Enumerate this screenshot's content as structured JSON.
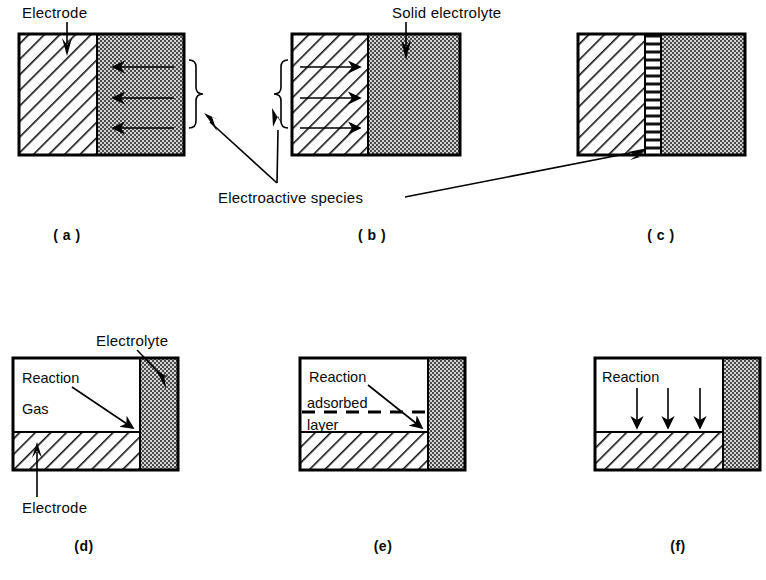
{
  "figure": {
    "title": "",
    "background_color": "#ffffff",
    "ink_color": "#000000",
    "electrolyte_fill_color": "#c9c9c9",
    "electrode_fill_color": "#ffffff",
    "gas_fill_color": "#ffffff"
  },
  "labels": {
    "electrode_top": "Electrode",
    "solid_electrolyte": "Solid  electrolyte",
    "electroactive_species": "Electroactive   species",
    "electrolyte_d": "Electrolyte",
    "electrode_d": "Electrode",
    "reaction_d": "Reaction",
    "gas_d": "Gas",
    "reaction_e": "Reaction",
    "adsorbed_e": "adsorbed",
    "layer_e": "layer",
    "reaction_f": "Reaction"
  },
  "panels": [
    {
      "id": "a",
      "caption": "( a )",
      "description": "Electrode with hatched fill on left, solid electrolyte with stippled fill on right; electroactive species arrows point leftward from electrolyte into electrode.",
      "regions": [
        {
          "name": "electrode",
          "fill": "hatch-diagonal"
        },
        {
          "name": "solid-electrolyte",
          "fill": "stipple-dot"
        }
      ],
      "arrows": {
        "direction": "left",
        "count": 3,
        "located_in": "solid-electrolyte"
      },
      "bracket": {
        "side": "right",
        "points_to": "electroactive-species"
      }
    },
    {
      "id": "b",
      "caption": "( b )",
      "description": "Electrode with hatched fill on left, solid electrolyte stippled on right; electroactive species arrows point rightward inside the electrode.",
      "regions": [
        {
          "name": "electrode",
          "fill": "hatch-diagonal"
        },
        {
          "name": "solid-electrolyte",
          "fill": "stipple-dot"
        }
      ],
      "arrows": {
        "direction": "right",
        "count": 3,
        "located_in": "electrode"
      },
      "bracket": {
        "side": "left",
        "points_to": "electroactive-species"
      }
    },
    {
      "id": "c",
      "caption": "( c )",
      "description": "Electrode hatched on left, a thin reaction interlayer with horizontal line hatching in the middle, solid electrolyte stippled on right.",
      "regions": [
        {
          "name": "electrode",
          "fill": "hatch-diagonal"
        },
        {
          "name": "interlayer",
          "fill": "hatch-horizontal"
        },
        {
          "name": "solid-electrolyte",
          "fill": "stipple-dot"
        }
      ],
      "arrows": {
        "direction": "none",
        "count": 0,
        "located_in": ""
      },
      "bracket": {
        "side": "none",
        "points_to": "electroactive-species"
      }
    },
    {
      "id": "d",
      "caption": "(d)",
      "description": "Gas region above a hatched electrode slab, with stippled electrolyte column at right; reaction occurs at the three-phase boundary point.",
      "regions": [
        {
          "name": "gas",
          "fill": "plain"
        },
        {
          "name": "electrode",
          "fill": "hatch-diagonal"
        },
        {
          "name": "electrolyte",
          "fill": "stipple-dot"
        }
      ],
      "arrows": {
        "direction": "diagonal-down-right",
        "count": 1,
        "located_in": "gas"
      },
      "bracket": {
        "side": "none",
        "points_to": ""
      }
    },
    {
      "id": "e",
      "caption": "(e)",
      "description": "Gas region with a dashed adsorbed layer above the hatched electrode, stippled electrolyte column at right; reaction arrow points to the boundary.",
      "regions": [
        {
          "name": "gas",
          "fill": "plain"
        },
        {
          "name": "adsorbed-layer",
          "fill": "dashed-line"
        },
        {
          "name": "electrode",
          "fill": "hatch-diagonal"
        },
        {
          "name": "electrolyte",
          "fill": "stipple-dot"
        }
      ],
      "arrows": {
        "direction": "diagonal-down-right",
        "count": 1,
        "located_in": "gas"
      },
      "bracket": {
        "side": "none",
        "points_to": ""
      }
    },
    {
      "id": "f",
      "caption": "(f)",
      "description": "Gas region above hatched electrode with stippled electrolyte column at right; three downward reaction arrows strike the electrode surface.",
      "regions": [
        {
          "name": "gas",
          "fill": "plain"
        },
        {
          "name": "electrode",
          "fill": "hatch-diagonal"
        },
        {
          "name": "electrolyte",
          "fill": "stipple-dot"
        }
      ],
      "arrows": {
        "direction": "down",
        "count": 3,
        "located_in": "gas"
      },
      "bracket": {
        "side": "none",
        "points_to": ""
      }
    }
  ]
}
